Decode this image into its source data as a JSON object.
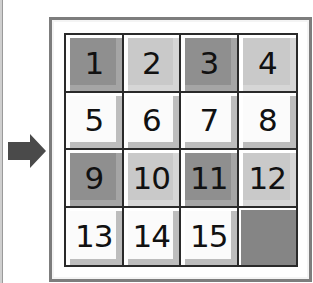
{
  "puzzle": {
    "type": "15-puzzle",
    "arrow": {
      "direction": "right",
      "color": "#4a4a4a"
    },
    "colors": {
      "dark": "#8f8f8f",
      "light": "#c9c9c9",
      "white": "#fbfbfb",
      "empty": "#858585",
      "grid_line": "#2a2a2a",
      "frame": "#7d7d7d"
    },
    "tiles": [
      {
        "label": "1",
        "shade": "dark"
      },
      {
        "label": "2",
        "shade": "light"
      },
      {
        "label": "3",
        "shade": "dark"
      },
      {
        "label": "4",
        "shade": "light"
      },
      {
        "label": "5",
        "shade": "white"
      },
      {
        "label": "6",
        "shade": "white"
      },
      {
        "label": "7",
        "shade": "white"
      },
      {
        "label": "8",
        "shade": "white"
      },
      {
        "label": "9",
        "shade": "dark"
      },
      {
        "label": "10",
        "shade": "light"
      },
      {
        "label": "11",
        "shade": "dark"
      },
      {
        "label": "12",
        "shade": "light"
      },
      {
        "label": "13",
        "shade": "white"
      },
      {
        "label": "14",
        "shade": "white"
      },
      {
        "label": "15",
        "shade": "white"
      },
      {
        "label": "",
        "shade": "empty"
      }
    ]
  }
}
